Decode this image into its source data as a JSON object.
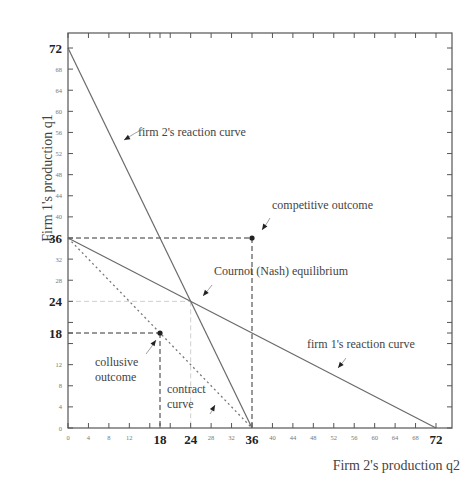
{
  "chart_data": {
    "type": "line",
    "title": "",
    "xlabel": "Firm 2's production q2",
    "ylabel": "Firm 1's production q1",
    "xlim": [
      0,
      72
    ],
    "ylim": [
      0,
      72
    ],
    "grid": false,
    "legend": "none",
    "x_ticks": [
      0,
      4,
      8,
      12,
      16,
      18,
      20,
      24,
      28,
      32,
      36,
      40,
      44,
      48,
      52,
      56,
      60,
      64,
      68,
      72
    ],
    "x_tick_labels": [
      {
        "v": 0,
        "t": "0",
        "big": false
      },
      {
        "v": 4,
        "t": "4",
        "big": false
      },
      {
        "v": 8,
        "t": "8",
        "big": false
      },
      {
        "v": 12,
        "t": "12",
        "big": false
      },
      {
        "v": 18,
        "t": "18",
        "big": true
      },
      {
        "v": 24,
        "t": "24",
        "big": true
      },
      {
        "v": 28,
        "t": "28",
        "big": false
      },
      {
        "v": 32,
        "t": "32",
        "big": false
      },
      {
        "v": 36,
        "t": "36",
        "big": true
      },
      {
        "v": 40,
        "t": "40",
        "big": false
      },
      {
        "v": 44,
        "t": "44",
        "big": false
      },
      {
        "v": 48,
        "t": "48",
        "big": false
      },
      {
        "v": 52,
        "t": "52",
        "big": false
      },
      {
        "v": 56,
        "t": "56",
        "big": false
      },
      {
        "v": 60,
        "t": "60",
        "big": false
      },
      {
        "v": 64,
        "t": "64",
        "big": false
      },
      {
        "v": 68,
        "t": "68",
        "big": false
      },
      {
        "v": 72,
        "t": "72",
        "big": true
      }
    ],
    "y_ticks": [
      0,
      4,
      8,
      12,
      16,
      18,
      20,
      24,
      28,
      32,
      36,
      40,
      44,
      48,
      52,
      56,
      60,
      64,
      68,
      72
    ],
    "y_tick_labels": [
      {
        "v": 0,
        "t": "0",
        "big": false
      },
      {
        "v": 4,
        "t": "4",
        "big": false
      },
      {
        "v": 8,
        "t": "8",
        "big": false
      },
      {
        "v": 12,
        "t": "12",
        "big": false
      },
      {
        "v": 18,
        "t": "18",
        "big": true
      },
      {
        "v": 24,
        "t": "24",
        "big": true
      },
      {
        "v": 28,
        "t": "28",
        "big": false
      },
      {
        "v": 32,
        "t": "32",
        "big": false
      },
      {
        "v": 36,
        "t": "36",
        "big": true
      },
      {
        "v": 40,
        "t": "40",
        "big": false
      },
      {
        "v": 44,
        "t": "44",
        "big": false
      },
      {
        "v": 48,
        "t": "48",
        "big": false
      },
      {
        "v": 52,
        "t": "52",
        "big": false
      },
      {
        "v": 56,
        "t": "56",
        "big": false
      },
      {
        "v": 60,
        "t": "60",
        "big": false
      },
      {
        "v": 64,
        "t": "64",
        "big": false
      },
      {
        "v": 68,
        "t": "68",
        "big": false
      },
      {
        "v": 72,
        "t": "72",
        "big": true
      }
    ],
    "series": [
      {
        "name": "firm 2's reaction curve",
        "style": "solid",
        "color": "#6a6a6a",
        "points": [
          [
            0,
            72
          ],
          [
            36,
            0
          ]
        ]
      },
      {
        "name": "firm 1's reaction curve",
        "style": "solid",
        "color": "#6a6a6a",
        "points": [
          [
            0,
            36
          ],
          [
            72,
            0
          ]
        ]
      },
      {
        "name": "contract curve",
        "style": "dotted",
        "color": "#777777",
        "points": [
          [
            0,
            36
          ],
          [
            36,
            0
          ]
        ]
      }
    ],
    "guides": [
      {
        "style": "dashed",
        "color": "#333333",
        "points": [
          [
            0,
            36
          ],
          [
            36,
            36
          ]
        ]
      },
      {
        "style": "dashed",
        "color": "#333333",
        "points": [
          [
            36,
            36
          ],
          [
            36,
            0
          ]
        ]
      },
      {
        "style": "dashed",
        "color": "#333333",
        "points": [
          [
            0,
            18
          ],
          [
            18,
            18
          ]
        ]
      },
      {
        "style": "dashed",
        "color": "#333333",
        "points": [
          [
            18,
            18
          ],
          [
            18,
            0
          ]
        ]
      },
      {
        "style": "dashed",
        "color": "#cfcfcf",
        "points": [
          [
            0,
            24
          ],
          [
            24,
            24
          ]
        ]
      },
      {
        "style": "dashed",
        "color": "#cfcfcf",
        "points": [
          [
            24,
            24
          ],
          [
            24,
            0
          ]
        ]
      }
    ],
    "points": [
      {
        "name": "competitive outcome",
        "x": 36,
        "y": 36
      },
      {
        "name": "collusive outcome",
        "x": 18,
        "y": 18
      },
      {
        "name": "Cournot (Nash) equilibrium",
        "x": 24,
        "y": 24
      }
    ],
    "annotations": [
      {
        "text": "firm 2's reaction curve",
        "lines": [
          "firm 2's reaction curve"
        ],
        "tx": 138,
        "ty": 136,
        "ax": 124,
        "ay": 140,
        "hx": 143,
        "hy": 129
      },
      {
        "text": "competitive outcome",
        "lines": [
          "competitive outcome"
        ],
        "tx": 272,
        "ty": 209,
        "ax": 262,
        "ay": 230,
        "hx": 270,
        "hy": 218
      },
      {
        "text": "Cournot (Nash) equilibrium",
        "lines": [
          "Cournot (Nash) equilibrium"
        ],
        "tx": 214,
        "ty": 275,
        "ax": 203,
        "ay": 296,
        "hx": 212,
        "hy": 285
      },
      {
        "text": "firm 1's reaction curve",
        "lines": [
          "firm 1's reaction curve"
        ],
        "tx": 307,
        "ty": 348,
        "ax": 338,
        "ay": 368,
        "hx": 346,
        "hy": 358
      },
      {
        "text": "collusive outcome",
        "lines": [
          "collusive",
          "outcome"
        ],
        "tx": 95,
        "ty": 366,
        "ax": 156,
        "ay": 340,
        "hx": 146,
        "hy": 354
      },
      {
        "text": "contract curve",
        "lines": [
          "contract",
          "curve"
        ],
        "tx": 167,
        "ty": 393,
        "ax": 215,
        "ay": 405,
        "hx": 210,
        "hy": 414
      }
    ]
  }
}
